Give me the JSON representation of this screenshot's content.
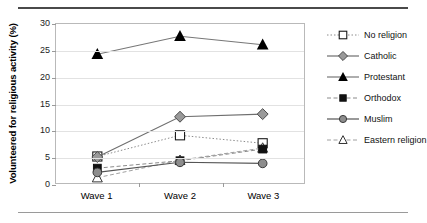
{
  "chart_data": {
    "type": "line",
    "title": "",
    "xlabel": "",
    "ylabel": "Volunteered for religious activity (%)",
    "categories": [
      "Wave 1",
      "Wave 2",
      "Wave 3"
    ],
    "ylim": [
      0,
      30
    ],
    "yticks": [
      0,
      5,
      10,
      15,
      20,
      25,
      30
    ],
    "grid": true,
    "legend_position": "right",
    "series": [
      {
        "name": "No religion",
        "values": [
          5.0,
          9.0,
          7.5
        ],
        "marker": "open-square",
        "line": "dotted",
        "color": "#8c8c8c"
      },
      {
        "name": "Catholic",
        "values": [
          4.9,
          12.5,
          13.0
        ],
        "marker": "grey-diamond",
        "line": "solid",
        "color": "#6e6e6e"
      },
      {
        "name": "Protestant",
        "values": [
          24.3,
          27.7,
          26.1
        ],
        "marker": "filled-triangle",
        "line": "solid",
        "color": "#777777"
      },
      {
        "name": "Orthodox",
        "values": [
          2.8,
          4.2,
          6.4
        ],
        "marker": "filled-square",
        "line": "dashed",
        "color": "#8a8a8a"
      },
      {
        "name": "Muslim",
        "values": [
          2.0,
          3.9,
          3.7
        ],
        "marker": "grey-circle",
        "line": "solid",
        "color": "#555555"
      },
      {
        "name": "Eastern religion",
        "values": [
          1.0,
          4.3,
          6.6
        ],
        "marker": "open-triangle",
        "line": "dashed",
        "color": "#a0a0a0"
      }
    ]
  },
  "axis": {
    "ytick_labels": [
      "0",
      "5",
      "10",
      "15",
      "20",
      "25",
      "30"
    ],
    "xtick_labels": [
      "Wave 1",
      "Wave 2",
      "Wave 3"
    ],
    "ylabel_text": "Volunteered for religious activity (%)"
  },
  "legend": {
    "items": [
      {
        "label": "No religion"
      },
      {
        "label": "Catholic"
      },
      {
        "label": "Protestant"
      },
      {
        "label": "Orthodox"
      },
      {
        "label": "Muslim"
      },
      {
        "label": "Eastern religion"
      }
    ]
  }
}
